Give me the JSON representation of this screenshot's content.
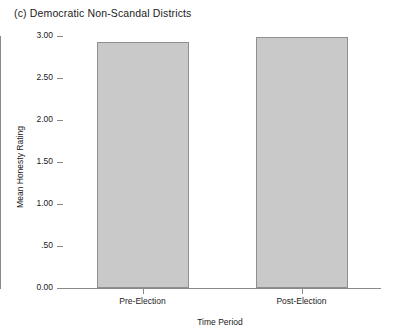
{
  "chart_data": {
    "type": "bar",
    "title": "(c) Democratic Non-Scandal Districts",
    "xlabel": "Time Period",
    "ylabel": "Mean Honesty Rating",
    "categories": [
      "Pre-Election",
      "Post-Election"
    ],
    "values": [
      2.93,
      2.99
    ],
    "ylim": [
      0.0,
      3.0
    ],
    "yticks": [
      0.0,
      0.5,
      1.0,
      1.5,
      2.0,
      2.5,
      3.0
    ],
    "ytick_labels": [
      "0.00",
      ".50",
      "1.00",
      "1.50",
      "2.00",
      "2.50",
      "3.00"
    ],
    "grid": false,
    "legend": null,
    "bar_color": "#c9c9c9",
    "bar_edge_color": "#8f8f8f",
    "axis_color": "#8a8a8a"
  }
}
